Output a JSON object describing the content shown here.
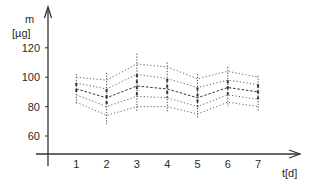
{
  "chart_data": {
    "type": "line",
    "title": "",
    "xlabel": "t[d]",
    "ylabel_line1": "m",
    "ylabel_line2": "[µg]",
    "x": [
      1,
      2,
      3,
      4,
      5,
      6,
      7
    ],
    "x_ticks": [
      "1",
      "2",
      "3",
      "4",
      "5",
      "6",
      "7"
    ],
    "y_ticks": [
      "60",
      "80",
      "100",
      "120"
    ],
    "ylim": [
      48,
      128
    ],
    "xlim": [
      0,
      8
    ],
    "grid": false,
    "legend": null,
    "series": [
      {
        "name": "upper outer",
        "style": "dotted",
        "values": [
          100,
          98,
          109,
          107,
          99,
          104,
          100
        ]
      },
      {
        "name": "upper inner",
        "style": "dotted",
        "values": [
          96,
          92,
          102,
          99,
          93,
          98,
          95
        ]
      },
      {
        "name": "mean",
        "style": "dashed",
        "values": [
          92,
          86,
          94,
          92,
          86,
          93,
          90
        ]
      },
      {
        "name": "lower inner",
        "style": "dotted",
        "values": [
          88,
          80,
          87,
          86,
          80,
          88,
          85
        ]
      },
      {
        "name": "lower outer",
        "style": "dotted",
        "values": [
          83,
          74,
          80,
          80,
          75,
          83,
          80
        ]
      }
    ],
    "error_bars": {
      "low": [
        82,
        68,
        76,
        76,
        72,
        80,
        77
      ],
      "high": [
        102,
        103,
        116,
        110,
        102,
        107,
        101
      ]
    }
  }
}
